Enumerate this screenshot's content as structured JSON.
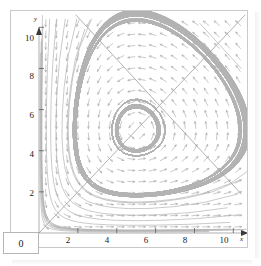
{
  "figure": {
    "kind": "phase-portrait",
    "background": "#ffffff",
    "frame_color": "#c9c9c9"
  },
  "origin": {
    "label": "0"
  },
  "axes": {
    "x_name": "x",
    "y_name": "y",
    "x_ticks": [
      {
        "value": 2,
        "label": "2"
      },
      {
        "value": 4,
        "label": "4"
      },
      {
        "value": 6,
        "label": "6"
      },
      {
        "value": 8,
        "label": "8"
      },
      {
        "value": 10,
        "label": "10"
      }
    ],
    "y_ticks": [
      {
        "value": 2,
        "label": "2"
      },
      {
        "value": 4,
        "label": "4"
      },
      {
        "value": 6,
        "label": "6"
      },
      {
        "value": 8,
        "label": "8"
      },
      {
        "value": 10,
        "label": "10"
      }
    ]
  },
  "chart_data": {
    "type": "scatter",
    "title": "",
    "xlabel": "x",
    "ylabel": "y",
    "xlim": [
      0,
      10.6
    ],
    "ylim": [
      0,
      10.6
    ],
    "grid": false,
    "legend": "none",
    "field": {
      "description": "direction field of a planar autonomous system with a saddle equilibrium",
      "arrow_color": "#9a9a9a",
      "arrow_length": 7,
      "sample_step": 0.55,
      "equations": {
        "dx": "x*(5 - y)*0.1",
        "dy": "y*(x - 5)*0.1"
      }
    },
    "equilibrium_points": [
      {
        "x": 5,
        "y": 5,
        "type": "saddle"
      },
      {
        "x": 0,
        "y": 0,
        "type": "node"
      }
    ],
    "separatrices": [
      {
        "name": "stable-separatrix",
        "from": [
          0,
          0
        ],
        "to": [
          10.6,
          10.6
        ]
      },
      {
        "name": "unstable-separatrix",
        "from": [
          1.9,
          10.6
        ],
        "to": [
          10.4,
          1.9
        ]
      }
    ],
    "trajectory_seeds": [
      [
        0.55,
        10.4
      ],
      [
        0.9,
        10.4
      ],
      [
        1.35,
        10.4
      ],
      [
        1.95,
        10.4
      ],
      [
        2.7,
        10.4
      ],
      [
        3.6,
        10.4
      ],
      [
        4.6,
        10.4
      ],
      [
        10.4,
        10.4
      ],
      [
        10.4,
        9.3
      ],
      [
        10.4,
        8.0
      ],
      [
        10.4,
        6.6
      ],
      [
        10.4,
        5.2
      ],
      [
        10.4,
        3.9
      ],
      [
        10.4,
        2.6
      ],
      [
        0.35,
        0.35
      ],
      [
        0.6,
        0.3
      ],
      [
        0.95,
        0.25
      ],
      [
        1.5,
        0.2
      ],
      [
        2.3,
        0.18
      ],
      [
        3.4,
        0.15
      ],
      [
        4.8,
        0.12
      ],
      [
        4.35,
        5.9
      ],
      [
        5.6,
        4.2
      ],
      [
        3.9,
        4.35
      ],
      [
        6.0,
        5.7
      ]
    ],
    "curve_color": "#b3b3b3"
  }
}
